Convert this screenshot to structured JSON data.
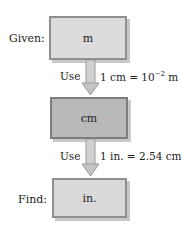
{
  "diagram": {
    "given_label": "Given:",
    "find_label": "Find:",
    "boxes": [
      {
        "label": "m"
      },
      {
        "label": "cm"
      },
      {
        "label": "in."
      }
    ],
    "steps": [
      {
        "use_label": "Use",
        "rule_prefix": "1 cm = 10",
        "rule_exp": "−2",
        "rule_suffix": " m"
      },
      {
        "use_label": "Use",
        "rule": "1 in. = 2.54 cm"
      }
    ],
    "colors": {
      "box_light": "#dcdcdc",
      "box_dark": "#b9b9b9",
      "arrow": "#b0b0b0"
    }
  }
}
